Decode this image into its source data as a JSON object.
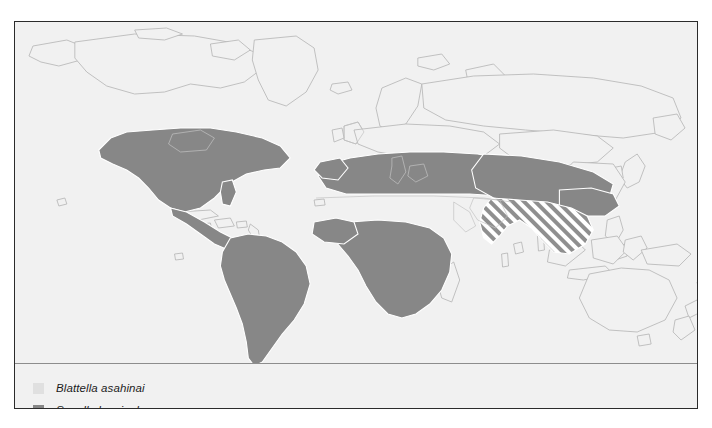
{
  "figure": {
    "type": "distribution-map",
    "background_color": "#f1f1f1",
    "frame_color": "#2b2b2b",
    "coastline_color": "#b9b9b9"
  },
  "legend": {
    "items": [
      {
        "label": "Blattella asahinai",
        "swatch_color": "#e0e0e0",
        "swatch_name": "legend-swatch-blattella-asahinai",
        "pattern": "solid"
      },
      {
        "label": "Supella longipalpa",
        "swatch_color": "#878787",
        "swatch_name": "legend-swatch-supella-longipalpa",
        "pattern": "solid"
      }
    ]
  },
  "map_data": {
    "projection": "equirectangular-world",
    "ocean_color": "#f1f1f1",
    "land_outline_color": "#b9b9b9",
    "species_fill": {
      "supella_longipalpa": "#878787",
      "blattella_asahinai": "#e0e0e0",
      "overlap_hatch": "diagonal-stripes"
    },
    "regions": [
      {
        "name": "North America",
        "species": "Supella longipalpa",
        "fill": "#878787",
        "notes": "Continental United States, southern Canada border, Mexico"
      },
      {
        "name": "Central America",
        "species": "Supella longipalpa",
        "fill": "#878787",
        "notes": "Isthmus from Mexico to Panama"
      },
      {
        "name": "South America",
        "species": "Supella longipalpa",
        "fill": "#878787",
        "notes": "Entire continent including Argentina and Chile"
      },
      {
        "name": "Mediterranean and North Africa",
        "species": "Supella longipalpa",
        "fill": "#878787",
        "notes": "Band across Iberia, Italy, Greece, Turkey, Maghreb, Egypt"
      },
      {
        "name": "Sub-Saharan Africa",
        "species": "Supella longipalpa",
        "fill": "#878787",
        "notes": "Sahel south through Central and Southern Africa"
      },
      {
        "name": "Middle East and Southern Asia",
        "species": "Supella longipalpa",
        "fill": "#878787",
        "notes": "Arabian margin, Iran, northern India, southern China"
      },
      {
        "name": "Indian subcontinent and Southeast Asia",
        "species": "Both species overlap",
        "fill": "hatched",
        "notes": "Diagonal hatching indicating Blattella asahinai overlap"
      },
      {
        "name": "Sahara and Arabian Peninsula",
        "species": "none",
        "fill": "#f1f1f1",
        "notes": "Unshaded gap between North African and Sahel bands"
      },
      {
        "name": "Northern Europe, Russia, Canada, Greenland",
        "species": "none",
        "fill": "#f1f1f1",
        "notes": "Outline only, no shading"
      },
      {
        "name": "Australia, New Zealand, Madagascar",
        "species": "none",
        "fill": "#f1f1f1",
        "notes": "Outline only, no shading"
      }
    ]
  }
}
